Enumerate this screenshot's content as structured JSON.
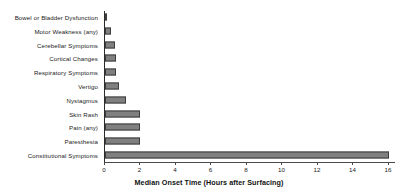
{
  "chart_data": {
    "type": "bar",
    "orientation": "horizontal",
    "title": "",
    "xlabel": "Median Onset Time (Hours after Surfacing)",
    "ylabel": "",
    "xlim": [
      0,
      16.4
    ],
    "xticks": [
      0,
      2,
      4,
      6,
      8,
      10,
      12,
      14,
      16
    ],
    "xticklabels": [
      "0",
      "2",
      "4",
      "6",
      "8",
      "10",
      "12",
      "14",
      "16"
    ],
    "grid": false,
    "legend": null,
    "bar_color": "#808080",
    "bar_edge_color": "#3d3d3d",
    "categories": [
      "Bowel or Bladder Dysfunction",
      "Motor Weakness (any)",
      "Cerebellar Symptoms",
      "Cortical Changes",
      "Respiratory Symptoms",
      "Vertigo",
      "Nystagmus",
      "Skin Rash",
      "Pain (any)",
      "Paresthesia",
      "Constitutional Symptoms"
    ],
    "values": [
      0.12,
      0.35,
      0.55,
      0.6,
      0.6,
      0.8,
      1.2,
      2.0,
      2.0,
      2.0,
      16.0
    ]
  }
}
